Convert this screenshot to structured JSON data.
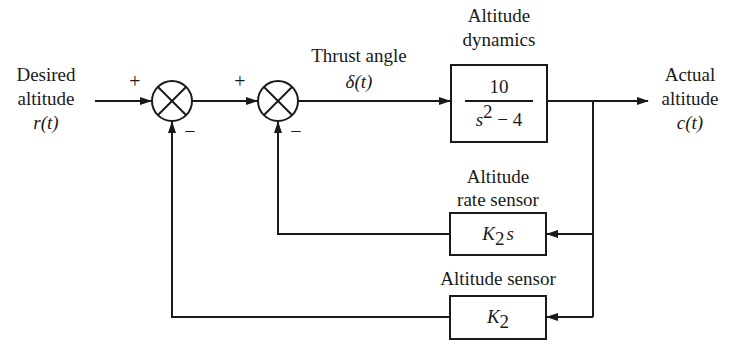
{
  "diagram": {
    "type": "feedback control block diagram",
    "input": {
      "label_line1": "Desired",
      "label_line2": "altitude",
      "signal": "r(t)"
    },
    "summing_junction_1": {
      "plus_sign": "+",
      "minus_sign": "−"
    },
    "summing_junction_2": {
      "plus_sign": "+",
      "minus_sign": "−"
    },
    "intermediate_signal": {
      "label": "Thrust angle",
      "signal": "δ(t)"
    },
    "plant": {
      "title_line1": "Altitude",
      "title_line2": "dynamics",
      "numerator": "10",
      "denominator_base": "s",
      "denominator_exp": "2",
      "denominator_rest": " − 4"
    },
    "output": {
      "label_line1": "Actual",
      "label_line2": "altitude",
      "signal": "c(t)"
    },
    "rate_sensor": {
      "title_line1": "Altitude",
      "title_line2": "rate sensor",
      "gain_base": "K",
      "gain_sub": "2",
      "gain_suffix": "s"
    },
    "position_sensor": {
      "title": "Altitude sensor",
      "gain_base": "K",
      "gain_sub": "2"
    }
  }
}
